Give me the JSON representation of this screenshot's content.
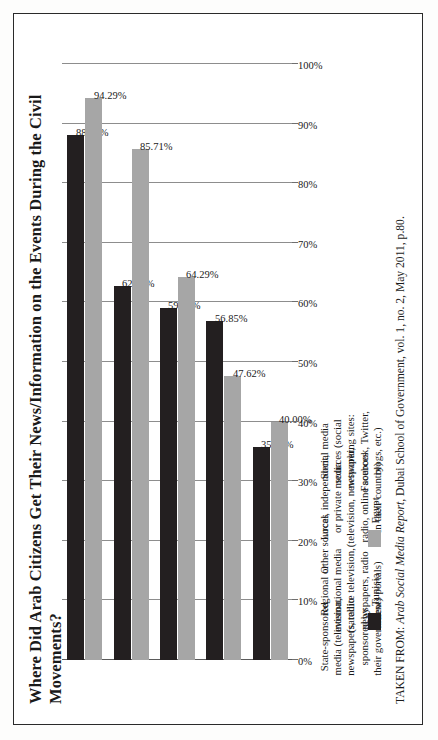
{
  "page": {
    "title": "Where Did Arab Citizens Get Their News/Information on the Events During the Civil Movements?",
    "source_prefix": "TAKEN FROM: ",
    "source_italic": "Arab Social Media Report",
    "source_rest": ", Dubai School of Government, vol. 1, no. 2, May 2011, p.80."
  },
  "legend": {
    "items": [
      {
        "label": "Tunisia",
        "color": "#231f20"
      },
      {
        "label": "Egypt",
        "color": "#a6a6a6"
      }
    ]
  },
  "axis": {
    "ticks": [
      "100%",
      "90%",
      "80%",
      "70%",
      "60%",
      "50%",
      "40%",
      "30%",
      "20%",
      "10%",
      "0%"
    ]
  },
  "chart_data": {
    "type": "bar",
    "title": "Where Did Arab Citizens Get Their News/Information on the Events During the Civil Movements?",
    "orientation": "vertical-grouped-rotated",
    "xlabel": "",
    "ylabel": "",
    "ylim": [
      0,
      100
    ],
    "ytick_labels": [
      "0%",
      "10%",
      "20%",
      "30%",
      "40%",
      "50%",
      "60%",
      "70%",
      "80%",
      "90%",
      "100%"
    ],
    "grid": true,
    "legend_position": "below-plot",
    "categories": [
      "Social media\nsources (social\nnetworking sites:\nFacebook, Twitter,\nblogs, etc.)",
      "Local, independent,\nor private media\n(television, newspaper,\nradio, online sources\nin their country)",
      "Other sources",
      "Regional or\ninternational media\n(satellite television,\nnewspapers, radio\nnews portals)",
      "State-sponsored\nmedia (television,\nnewspapers, radio\nsponsored by\ntheir government)"
    ],
    "series": [
      {
        "name": "Tunisia",
        "color": "#231f20",
        "values": [
          88.1,
          62.7,
          59.09,
          56.85,
          35.71
        ],
        "labels": [
          "88.10%",
          "62.70%",
          "59.09%",
          "56.85%",
          "35.71%"
        ]
      },
      {
        "name": "Egypt",
        "color": "#a6a6a6",
        "values": [
          94.29,
          85.71,
          64.29,
          47.62,
          40.0
        ],
        "labels": [
          "94.29%",
          "85.71%",
          "64.29%",
          "47.62%",
          "40.00%"
        ]
      }
    ]
  }
}
